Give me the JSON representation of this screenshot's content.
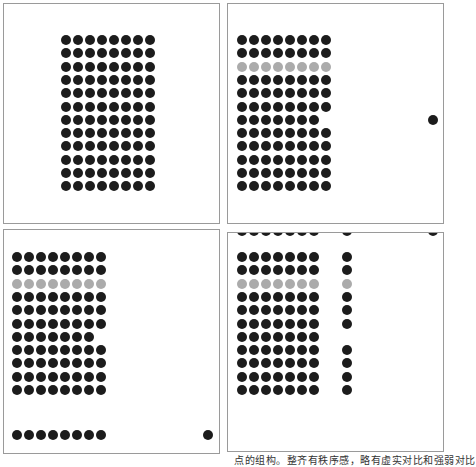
{
  "figure": {
    "dot_colors": {
      "dark": "#1c1c1c",
      "gray": "#ababab"
    },
    "dot_diameter": 10,
    "caption": "点的组构。整齐有秩序感，略有虚实对比和强弱对比"
  },
  "panels": [
    {
      "id": "panel-a",
      "box": {
        "left": 3,
        "top": 3,
        "width": 217,
        "height": 221
      },
      "grid": {
        "x0": 66,
        "y0": 40,
        "dx": 12,
        "dy": 13.3,
        "cols": 8,
        "rows": 12,
        "gray_rows": [],
        "missing": [],
        "extra_cols": []
      },
      "extra_dots": []
    },
    {
      "id": "panel-b",
      "box": {
        "left": 227,
        "top": 3,
        "width": 217,
        "height": 221
      },
      "grid": {
        "x0": 242,
        "y0": 40,
        "dx": 12,
        "dy": 13.3,
        "cols": 8,
        "rows": 12,
        "gray_rows": [
          2
        ],
        "missing": [
          [
            6,
            7
          ]
        ],
        "extra_cols": []
      },
      "extra_dots": [
        {
          "x": 433,
          "y": 120,
          "color": "dark"
        }
      ]
    },
    {
      "id": "panel-c",
      "box": {
        "left": 3,
        "top": 229,
        "width": 217,
        "height": 225
      },
      "grid": {
        "x0": 17,
        "y0": 257,
        "dx": 12,
        "dy": 13.3,
        "cols": 8,
        "rows": 11,
        "gray_rows": [
          2
        ],
        "missing": [
          [
            6,
            7
          ]
        ],
        "extra_cols": []
      },
      "extra_dots": [
        {
          "x": 17,
          "y": 435,
          "color": "dark"
        },
        {
          "x": 29,
          "y": 435,
          "color": "dark"
        },
        {
          "x": 41,
          "y": 435,
          "color": "dark"
        },
        {
          "x": 53,
          "y": 435,
          "color": "dark"
        },
        {
          "x": 65,
          "y": 435,
          "color": "dark"
        },
        {
          "x": 77,
          "y": 435,
          "color": "dark"
        },
        {
          "x": 89,
          "y": 435,
          "color": "dark"
        },
        {
          "x": 101,
          "y": 435,
          "color": "dark"
        },
        {
          "x": 208,
          "y": 435,
          "color": "dark"
        }
      ]
    },
    {
      "id": "panel-d",
      "box": {
        "left": 227,
        "top": 232,
        "width": 217,
        "height": 220
      },
      "grid": {
        "x0": 242,
        "y0": 257,
        "dx": 12,
        "dy": 13.3,
        "cols": 7,
        "rows": 11,
        "gray_rows": [
          2
        ],
        "missing": [],
        "extra_cols": []
      },
      "side_column": {
        "x": 347,
        "rows_present": [
          0,
          1,
          2,
          3,
          4,
          5,
          7,
          8,
          9,
          10
        ]
      },
      "extra_dots": [
        {
          "x": 242,
          "y": 231,
          "color": "dark"
        },
        {
          "x": 254,
          "y": 231,
          "color": "dark"
        },
        {
          "x": 266,
          "y": 231,
          "color": "dark"
        },
        {
          "x": 278,
          "y": 231,
          "color": "dark"
        },
        {
          "x": 290,
          "y": 231,
          "color": "dark"
        },
        {
          "x": 302,
          "y": 231,
          "color": "dark"
        },
        {
          "x": 314,
          "y": 231,
          "color": "dark"
        },
        {
          "x": 347,
          "y": 231,
          "color": "dark"
        },
        {
          "x": 433,
          "y": 231,
          "color": "dark"
        }
      ]
    }
  ]
}
